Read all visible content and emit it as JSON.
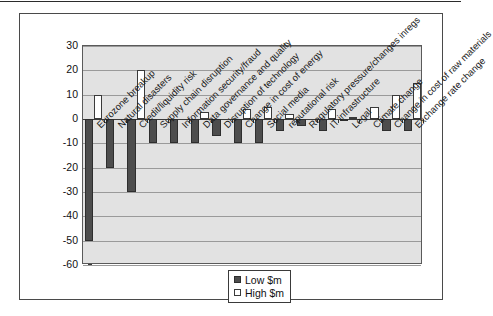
{
  "chart_data": {
    "type": "bar",
    "title": "",
    "subtitle": "",
    "xlabel": "",
    "ylabel": "",
    "ylim": [
      -60,
      30
    ],
    "ytick_values": [
      30,
      20,
      10,
      0,
      -10,
      -20,
      -30,
      -40,
      -50,
      -60
    ],
    "ytick_labels": [
      "30",
      "20",
      "10",
      "0",
      "-10",
      "-20",
      "-30",
      "-40",
      "-50",
      "-60"
    ],
    "grid": true,
    "legend_position": "bottom-center",
    "categories": [
      "Eurozone breakup",
      "Natural disasters",
      "Credit/liquidity risk",
      "Supply chain disruption",
      "Information security/fraud",
      "Data governance and quality",
      "Disruption of technology",
      "Change in cost of energy",
      "Social media",
      "reputational risk",
      "Regulatory pressure/changes inregs",
      "IT infrastructure",
      "Legal",
      "Climate change",
      "Change in cost of raw materials",
      "Exchange rate change"
    ],
    "series": [
      {
        "name": "Low $m",
        "color": "#4d4d4d",
        "values": [
          -50,
          -20,
          -30,
          -10,
          -10,
          -10,
          -7,
          -10,
          -10,
          -5,
          -3,
          -5,
          -1,
          0,
          -5,
          -5
        ]
      },
      {
        "name": "High $m",
        "color": "#ffffff",
        "values": [
          10,
          0,
          20,
          0,
          0,
          3,
          0,
          4,
          5,
          2,
          0,
          4,
          1,
          5,
          10,
          15
        ]
      }
    ]
  },
  "legend": {
    "items": [
      {
        "label": "Low $m",
        "swatch": "low"
      },
      {
        "label": "High $m",
        "swatch": "high"
      }
    ]
  }
}
